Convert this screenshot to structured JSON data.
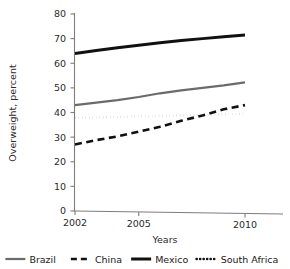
{
  "chart_data": {
    "type": "line",
    "title": "",
    "xlabel": "Years",
    "ylabel": "Overweight, percent",
    "xlim": [
      2002,
      2010
    ],
    "ylim": [
      0,
      80
    ],
    "x_ticks": [
      "2002",
      "2005",
      "2010"
    ],
    "x_tick_values": [
      2002,
      2005,
      2010
    ],
    "y_ticks": [
      "0",
      "10",
      "20",
      "30",
      "40",
      "50",
      "60",
      "70",
      "80"
    ],
    "y_tick_values": [
      0,
      10,
      20,
      30,
      40,
      50,
      60,
      70,
      80
    ],
    "grid": false,
    "legend_position": "bottom",
    "x": [
      2002,
      2003,
      2004,
      2005,
      2006,
      2007,
      2008,
      2009,
      2010
    ],
    "series": [
      {
        "name": "Brazil",
        "style": "solid",
        "color": "#6b6b6b",
        "width": 2.2,
        "values": [
          43.0,
          44.0,
          45.0,
          46.3,
          47.8,
          49.0,
          50.0,
          51.0,
          52.2
        ]
      },
      {
        "name": "China",
        "style": "dashed",
        "color": "#111111",
        "width": 2.6,
        "values": [
          27.0,
          28.8,
          30.3,
          32.2,
          34.2,
          36.6,
          38.8,
          41.3,
          43.0
        ]
      },
      {
        "name": "Mexico",
        "style": "solid",
        "color": "#111111",
        "width": 3.0,
        "values": [
          64.0,
          65.2,
          66.3,
          67.3,
          68.3,
          69.2,
          70.0,
          70.8,
          71.5
        ]
      },
      {
        "name": "South Africa",
        "style": "dotted",
        "color": "#111111",
        "width": 2.6,
        "values": [
          37.8,
          38.0,
          38.2,
          38.4,
          38.6,
          38.8,
          39.0,
          39.3,
          39.5
        ]
      }
    ]
  },
  "legend": {
    "items": [
      {
        "label": "Brazil"
      },
      {
        "label": "China"
      },
      {
        "label": "Mexico"
      },
      {
        "label": "South Africa"
      }
    ]
  },
  "colors": {
    "axis": "#7d7d7d",
    "text": "#2b2b2b",
    "brazil": "#6b6b6b",
    "china": "#111111",
    "mexico": "#111111",
    "south_africa": "#111111"
  }
}
